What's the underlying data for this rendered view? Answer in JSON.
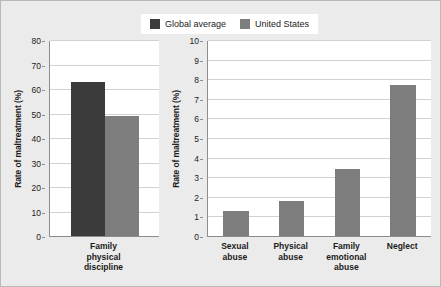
{
  "legend": {
    "entries": [
      {
        "label": "Global average",
        "color": "#3b3b3b",
        "swatch_name": "legend-swatch-global-average"
      },
      {
        "label": "United States",
        "color": "#7d7d7d",
        "swatch_name": "legend-swatch-united-states"
      }
    ]
  },
  "chart_data": [
    {
      "id": "left",
      "type": "bar",
      "title": "",
      "xlabel": "",
      "ylabel": "Rate of maltreatment (%)",
      "ylim": [
        0,
        80
      ],
      "ytick_step": 10,
      "yticks": [
        "0",
        "10",
        "20",
        "30",
        "40",
        "50",
        "60",
        "70",
        "80"
      ],
      "categories": [
        "Family physical discipline"
      ],
      "category_lines": [
        [
          "Family physical",
          "discipline"
        ]
      ],
      "grid": true,
      "legend_position": "top-center",
      "series": [
        {
          "name": "Global average",
          "color": "#3b3b3b",
          "values": [
            63
          ]
        },
        {
          "name": "United States",
          "color": "#7d7d7d",
          "values": [
            49
          ]
        }
      ]
    },
    {
      "id": "right",
      "type": "bar",
      "title": "",
      "xlabel": "",
      "ylabel": "Rate of maltreatment (%)",
      "ylim": [
        0,
        10
      ],
      "ytick_step": 1,
      "yticks": [
        "0",
        "1",
        "2",
        "3",
        "4",
        "5",
        "6",
        "7",
        "8",
        "9",
        "10"
      ],
      "categories": [
        "Sexual abuse",
        "Physical abuse",
        "Family emotional abuse",
        "Neglect"
      ],
      "category_lines": [
        [
          "Sexual",
          "abuse"
        ],
        [
          "Physical",
          "abuse"
        ],
        [
          "Family",
          "emotional",
          "abuse"
        ],
        [
          "Neglect"
        ]
      ],
      "grid": true,
      "legend_position": "top-center",
      "series": [
        {
          "name": "United States",
          "color": "#7d7d7d",
          "values": [
            1.3,
            1.8,
            3.4,
            7.7
          ]
        }
      ]
    }
  ],
  "colors": {
    "page_background": "#ebebeb",
    "plot_background": "#ffffff",
    "gridline": "#d2d2d2",
    "axis": "#8d8d8d",
    "text": "#1b1b1b",
    "global_average": "#3b3b3b",
    "united_states": "#7d7d7d"
  }
}
